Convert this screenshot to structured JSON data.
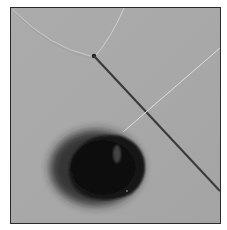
{
  "image": {
    "description": "Grayscale photograph of a dark round object with thin threads and a thin needle-like rod on a gray surface, inside a thin dark frame",
    "colors": {
      "background": "#a8a8a8",
      "frame": "#2a2a2a",
      "object": "#0d0d0d",
      "rod": "#3a3a3a",
      "thread": "#d8d8d8"
    }
  }
}
